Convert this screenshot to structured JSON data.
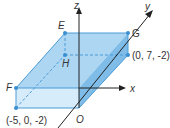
{
  "diagram": {
    "type": "3d-cuboid-coordinate-axes",
    "axes": {
      "x": {
        "label": "x"
      },
      "y": {
        "label": "y"
      },
      "z": {
        "label": "z"
      }
    },
    "vertices": {
      "E": {
        "label": "E"
      },
      "F": {
        "label": "F"
      },
      "G": {
        "label": "G"
      },
      "H": {
        "label": "H"
      },
      "O": {
        "label": "O"
      }
    },
    "coordinates": {
      "bottom_left": "(-5, 0, -2)",
      "back_right": "(0, 7, -2)"
    },
    "colors": {
      "top_face": "#a9d4f2",
      "front_face": "#d6ecfa",
      "right_face": "#7fbde8",
      "edge": "#4a9bd6",
      "point": "#3a8fd0",
      "axis": "#222222"
    }
  }
}
